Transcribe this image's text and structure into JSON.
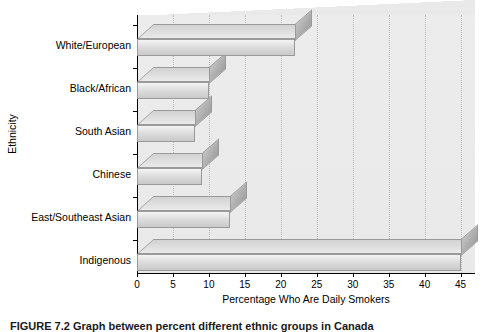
{
  "figure": {
    "caption": "FIGURE 7.2   Graph between percent different ethnic groups in Canada"
  },
  "chart_data": {
    "type": "bar",
    "orientation": "horizontal",
    "title": "",
    "xlabel": "Percentage Who Are Daily Smokers",
    "ylabel": "Ethnicity",
    "categories": [
      "White/European",
      "Black/African",
      "South Asian",
      "Chinese",
      "East/Southeast Asian",
      "Indigenous"
    ],
    "values": [
      22,
      10,
      8,
      9,
      13,
      45
    ],
    "xlim": [
      0,
      47
    ],
    "xticks": [
      0,
      5,
      10,
      15,
      20,
      25,
      30,
      35,
      40,
      45
    ],
    "xticklabels": [
      "0",
      "5",
      "10",
      "15",
      "20",
      "25",
      "30",
      "35",
      "40",
      "45"
    ],
    "grid": true,
    "legend": null,
    "style": "3d-bar",
    "bar_color": "#dedede",
    "plot_background": "#ececec",
    "axis_color": "#000000"
  }
}
